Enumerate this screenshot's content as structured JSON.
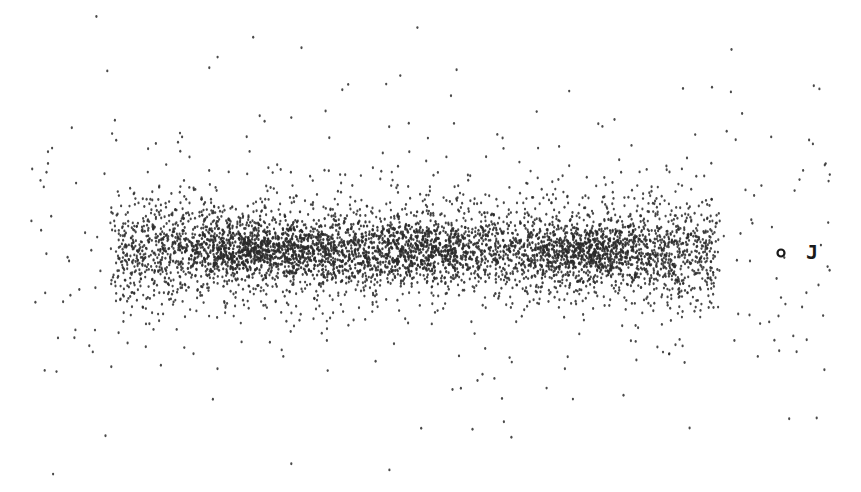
{
  "chart_data": {
    "type": "scatter",
    "title": "",
    "xlabel": "",
    "ylabel": "",
    "axes_visible": false,
    "grid": false,
    "legend": null,
    "point_color": "#2a2a2a",
    "background": "#ffffff",
    "band": {
      "x_min": 110,
      "x_max": 720,
      "y_center": 250,
      "y_spread": 34
    },
    "clumps": [
      {
        "x": 245,
        "y": 250,
        "weight": 1.0
      },
      {
        "x": 330,
        "y": 248,
        "weight": 0.6
      },
      {
        "x": 430,
        "y": 250,
        "weight": 0.8
      },
      {
        "x": 585,
        "y": 252,
        "weight": 1.0
      }
    ],
    "approx_point_count": 5000,
    "annotations": [
      {
        "label": "J",
        "marker": "open-circle",
        "x": 781,
        "y": 253,
        "label_x": 808,
        "label_y": 252
      }
    ]
  }
}
